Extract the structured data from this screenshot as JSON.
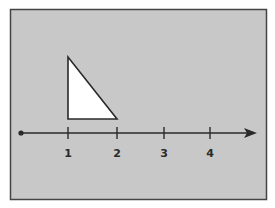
{
  "diagram": {
    "type": "number-line-with-triangle",
    "frame": {
      "fill": "#c8c8c8",
      "stroke": "#444444"
    },
    "number_line": {
      "ticks": [
        {
          "value": 1,
          "label": "1"
        },
        {
          "value": 2,
          "label": "2"
        },
        {
          "value": 3,
          "label": "3"
        },
        {
          "value": 4,
          "label": "4"
        }
      ],
      "has_origin_dot": true,
      "has_arrow": true,
      "color": "#2a2a2a"
    },
    "triangle": {
      "kind": "right-triangle",
      "base_from": 1,
      "base_to": 2,
      "fill": "#ffffff",
      "stroke": "#2a2a2a"
    }
  }
}
